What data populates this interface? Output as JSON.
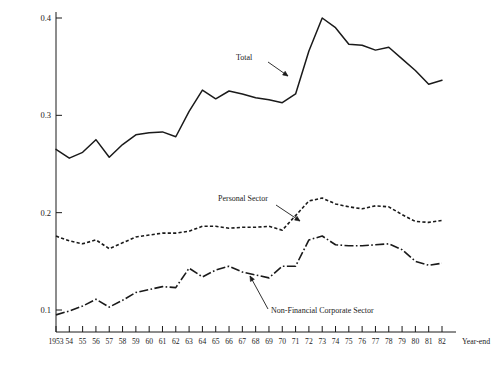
{
  "chart_data": {
    "type": "line",
    "title": "",
    "xlabel": "Year-end",
    "ylabel": "",
    "ylim": [
      0.08,
      0.41
    ],
    "yticks": [
      0.1,
      0.2,
      0.3,
      0.4
    ],
    "ytick_labels": [
      "0.1",
      "0.2",
      "0.3",
      "0.4"
    ],
    "grid": false,
    "legend_position": "inline-annotations",
    "x": [
      1953,
      1954,
      1955,
      1956,
      1957,
      1958,
      1959,
      1960,
      1961,
      1962,
      1963,
      1964,
      1965,
      1966,
      1967,
      1968,
      1969,
      1970,
      1971,
      1972,
      1973,
      1974,
      1975,
      1976,
      1977,
      1978,
      1979,
      1980,
      1981,
      1982
    ],
    "xtick_labels": [
      "1953",
      "54",
      "55",
      "56",
      "57",
      "58",
      "59",
      "60",
      "61",
      "62",
      "63",
      "64",
      "65",
      "66",
      "67",
      "68",
      "69",
      "70",
      "71",
      "72",
      "73",
      "74",
      "75",
      "76",
      "77",
      "78",
      "79",
      "80",
      "81",
      "82"
    ],
    "series": [
      {
        "name": "Total",
        "style": "solid",
        "values": [
          0.265,
          0.256,
          0.262,
          0.275,
          0.257,
          0.27,
          0.28,
          0.282,
          0.283,
          0.278,
          0.304,
          0.326,
          0.317,
          0.325,
          0.322,
          0.318,
          0.316,
          0.313,
          0.322,
          0.366,
          0.4,
          0.39,
          0.373,
          0.372,
          0.367,
          0.37,
          0.358,
          0.346,
          0.332,
          0.336
        ]
      },
      {
        "name": "Personal Sector",
        "style": "dotted",
        "values": [
          0.176,
          0.171,
          0.168,
          0.172,
          0.163,
          0.169,
          0.175,
          0.177,
          0.179,
          0.179,
          0.181,
          0.186,
          0.186,
          0.184,
          0.185,
          0.185,
          0.186,
          0.182,
          0.197,
          0.212,
          0.215,
          0.209,
          0.206,
          0.204,
          0.207,
          0.206,
          0.198,
          0.191,
          0.19,
          0.192
        ]
      },
      {
        "name": "Non-Financial Corporate Sector",
        "style": "dash-dot",
        "values": [
          0.095,
          0.099,
          0.104,
          0.111,
          0.103,
          0.11,
          0.118,
          0.121,
          0.124,
          0.123,
          0.143,
          0.134,
          0.141,
          0.145,
          0.139,
          0.136,
          0.133,
          0.145,
          0.145,
          0.172,
          0.176,
          0.167,
          0.166,
          0.166,
          0.167,
          0.168,
          0.162,
          0.15,
          0.146,
          0.148
        ]
      }
    ],
    "annotations": [
      {
        "label": "Total",
        "text_x": 236,
        "text_y": 60,
        "leader": "M 268 62 L 288 76"
      },
      {
        "label": "Personal Sector",
        "text_x": 218,
        "text_y": 201,
        "leader": "M 276 205 L 300 221"
      },
      {
        "label": "Non-Financial Corporate Sector",
        "text_x": 271,
        "text_y": 313,
        "leader": "M 268 309 L 250 276"
      }
    ]
  }
}
